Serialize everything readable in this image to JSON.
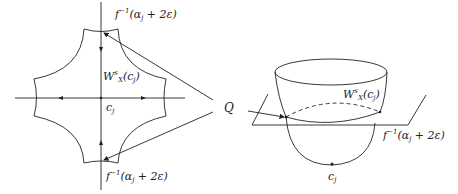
{
  "figure": {
    "left": {
      "label_top": "f",
      "label_top_sup": "−1",
      "label_top_arg": "(α",
      "label_top_sub": "j",
      "label_top_rest": " + 2ε)",
      "label_bottom": "f",
      "label_bottom_sup": "−1",
      "label_bottom_arg": "(α",
      "label_bottom_sub": "j",
      "label_bottom_rest": " + 2ε)",
      "manifold": "W",
      "manifold_sup": "s",
      "manifold_sub": "X",
      "manifold_arg": "(c",
      "manifold_arg_sub": "j",
      "manifold_close": ")",
      "critical_point": "c",
      "critical_point_sub": "j"
    },
    "pointer": {
      "label": "Q"
    },
    "right": {
      "manifold": "W",
      "manifold_sup": "s",
      "manifold_sub": "X",
      "manifold_arg": "(c",
      "manifold_arg_sub": "j",
      "manifold_close": ")",
      "level_set": "f",
      "level_set_sup": "−1",
      "level_set_arg": "(α",
      "level_set_sub": "j",
      "level_set_rest": " + 2ε)",
      "critical_point": "c",
      "critical_point_sub": "j"
    }
  }
}
